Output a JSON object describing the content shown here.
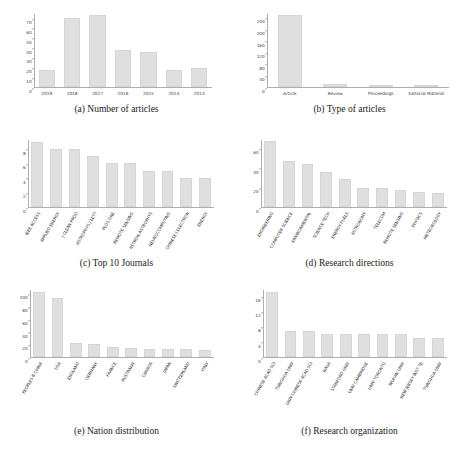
{
  "figure": {
    "background": "#ffffff",
    "bar_color": "#dfdfdf",
    "axis_color": "#aeaeae",
    "text_color": "#2e2e2e"
  },
  "panels": [
    {
      "id": "a",
      "caption": "(a) Number of articles"
    },
    {
      "id": "b",
      "caption": "(b) Type of articles"
    },
    {
      "id": "c",
      "caption": "(c) Top 10 Journals"
    },
    {
      "id": "d",
      "caption": "(d) Research directions"
    },
    {
      "id": "e",
      "caption": "(e) Nation distribution"
    },
    {
      "id": "f",
      "caption": "(f) Research organization"
    }
  ],
  "chart_data": [
    {
      "panel": "a",
      "type": "bar",
      "title": "(a) Number of articles",
      "xlabel": "",
      "ylabel": "",
      "categories": [
        "2019",
        "2018",
        "2017",
        "2016",
        "2015",
        "2014",
        "2013"
      ],
      "values": [
        18,
        70,
        73,
        38,
        36,
        18,
        20
      ],
      "yticks": [
        0,
        10,
        20,
        30,
        40,
        50,
        60,
        70
      ],
      "ylim": [
        0,
        75
      ],
      "label_rotation": 0,
      "grid": false,
      "legend": "none"
    },
    {
      "panel": "b",
      "type": "bar",
      "title": "(b) Type of articles",
      "xlabel": "",
      "ylabel": "",
      "categories": [
        "Article",
        "Review",
        "Proceedings",
        "Editorial Material"
      ],
      "values": [
        249,
        12,
        3,
        1
      ],
      "yticks": [
        0,
        40,
        80,
        120,
        160,
        200,
        240
      ],
      "ylim": [
        0,
        255
      ],
      "label_rotation": 0,
      "grid": false,
      "legend": "none"
    },
    {
      "panel": "c",
      "type": "bar",
      "title": "(c) Top 10 Journals",
      "xlabel": "",
      "ylabel": "",
      "categories": [
        "IEEE ACCESS",
        "APPLIED ENERGY",
        "J CLEAN PROD",
        "ASTROPHYS J LETT",
        "PLOS ONE",
        "REMOTE SENSING",
        "ASTRON ASTROPHYS",
        "NEUROCOMPUTING",
        "CHINESE J ELECTRON",
        "ENERGY"
      ],
      "values": [
        9,
        8,
        8,
        7,
        6,
        6,
        5,
        5,
        4,
        4
      ],
      "yticks": [
        0,
        2,
        4,
        6,
        8
      ],
      "ylim": [
        0,
        9.3
      ],
      "label_rotation": -60,
      "grid": false,
      "legend": "none"
    },
    {
      "panel": "d",
      "type": "bar",
      "title": "(d) Research directions",
      "xlabel": "",
      "ylabel": "",
      "categories": [
        "ENGINEERING",
        "COMPUTER SCIENCE",
        "ENVIRONMENTAL",
        "SCIENCE TECH",
        "ENERGY FUELS",
        "ASTRONOMY",
        "TELECOM",
        "REMOTE SENSING",
        "PHYSICS",
        "METEOROLOGY"
      ],
      "values": [
        67,
        47,
        44,
        36,
        29,
        20,
        20,
        18,
        16,
        15
      ],
      "yticks": [
        0,
        20,
        40,
        60
      ],
      "ylim": [
        0,
        69
      ],
      "label_rotation": -60,
      "grid": false,
      "legend": "none"
    },
    {
      "panel": "e",
      "type": "bar",
      "title": "(e) Nation distribution",
      "xlabel": "",
      "ylabel": "",
      "categories": [
        "PEOPLES R CHINA",
        "USA",
        "ENGLAND",
        "GERMANY",
        "FRANCE",
        "AUSTRALIA",
        "CANADA",
        "JAPAN",
        "SWITZERLAND",
        "ITALY"
      ],
      "values": [
        103,
        94,
        23,
        21,
        16,
        14,
        13,
        13,
        13,
        11
      ],
      "yticks": [
        0,
        20,
        40,
        60,
        80,
        100
      ],
      "ylim": [
        0,
        107
      ],
      "label_rotation": -60,
      "grid": false,
      "legend": "none"
    },
    {
      "panel": "f",
      "type": "bar",
      "title": "(f) Research organization",
      "xlabel": "",
      "ylabel": "",
      "categories": [
        "CHINESE ACAD SCI",
        "TSINGHUA UNIV",
        "UNIV CHINESE ACAD SCI",
        "NASA",
        "STANFORD UNIV",
        "UNIV CAMBRIDGE",
        "UNIV TORONTO",
        "WUHAN UNIV",
        "NEW JERSEY INST TE",
        "TSINGHUA UNIV"
      ],
      "values": [
        17,
        7,
        7,
        6,
        6,
        6,
        6,
        6,
        5,
        5
      ],
      "yticks": [
        0,
        4,
        8,
        12,
        16
      ],
      "ylim": [
        0,
        17.8
      ],
      "label_rotation": -60,
      "grid": false,
      "legend": "none"
    }
  ]
}
